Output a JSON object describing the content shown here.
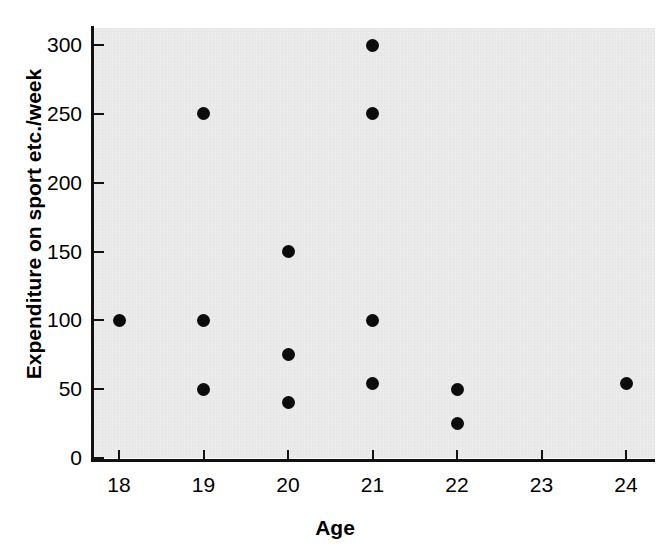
{
  "chart_data": {
    "type": "scatter",
    "title": "",
    "xlabel": "Age",
    "ylabel": "Expenditure on sport etc./week",
    "xlim": [
      17.7,
      24.4
    ],
    "ylim": [
      -10,
      312
    ],
    "grid": false,
    "legend": null,
    "x_ticks": [
      18,
      19,
      20,
      21,
      22,
      23,
      24
    ],
    "x_tick_labels": [
      "18",
      "19",
      "20",
      "21",
      "22",
      "23",
      "24"
    ],
    "y_ticks": [
      0,
      50,
      100,
      150,
      200,
      250,
      300
    ],
    "y_tick_labels": [
      "0",
      "50",
      "100",
      "150",
      "200",
      "250",
      "300"
    ],
    "marker": "filled-circle",
    "marker_color": "#0b0b0b",
    "plot_background": "#ebebeb",
    "page_background": "#ffffff",
    "points": [
      {
        "x": 18,
        "y": 100
      },
      {
        "x": 19,
        "y": 250
      },
      {
        "x": 19,
        "y": 100
      },
      {
        "x": 19,
        "y": 50
      },
      {
        "x": 20,
        "y": 150
      },
      {
        "x": 20,
        "y": 75
      },
      {
        "x": 20,
        "y": 40
      },
      {
        "x": 21,
        "y": 300
      },
      {
        "x": 21,
        "y": 250
      },
      {
        "x": 21,
        "y": 100
      },
      {
        "x": 21,
        "y": 54
      },
      {
        "x": 22,
        "y": 50
      },
      {
        "x": 22,
        "y": 25
      },
      {
        "x": 24,
        "y": 54
      }
    ]
  }
}
